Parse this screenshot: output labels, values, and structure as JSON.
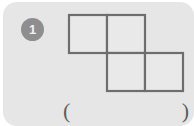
{
  "card": {
    "background_color": "#e6e6e6",
    "page_background_color": "#ffffff"
  },
  "question": {
    "number": "1",
    "badge_color": "#8e8e8e",
    "badge_text_color": "#f2f2f2"
  },
  "figure": {
    "name": "s-tetromino-net",
    "stroke_color": "#6e6e6e",
    "fill_color": "#e9e9e9",
    "stroke_width": 2,
    "cell_size": 58,
    "grid_columns": 3,
    "grid_rows": 2,
    "cells": [
      {
        "name": "square-top-left",
        "col": 0,
        "row": 0
      },
      {
        "name": "square-top-middle",
        "col": 1,
        "row": 0
      },
      {
        "name": "square-bottom-middle",
        "col": 1,
        "row": 1
      },
      {
        "name": "square-bottom-right",
        "col": 2,
        "row": 1
      }
    ]
  },
  "answer": {
    "open_paren": "(",
    "close_paren": ")",
    "value": "",
    "placeholder": ""
  }
}
